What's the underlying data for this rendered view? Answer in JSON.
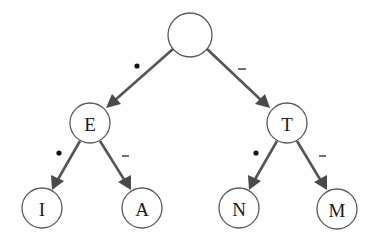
{
  "diagram": {
    "type": "binary-tree",
    "colors": {
      "node_stroke": "#5a5a5a",
      "edge": "#555555",
      "text": "#1a1a1a",
      "background": "#ffffff"
    },
    "nodes": [
      {
        "id": "root",
        "label": "",
        "cx": 190,
        "cy": 35,
        "r": 22
      },
      {
        "id": "E",
        "label": "E",
        "cx": 90,
        "cy": 123,
        "r": 20
      },
      {
        "id": "T",
        "label": "T",
        "cx": 287,
        "cy": 123,
        "r": 20
      },
      {
        "id": "I",
        "label": "I",
        "cx": 42,
        "cy": 208,
        "r": 20
      },
      {
        "id": "A",
        "label": "A",
        "cx": 142,
        "cy": 208,
        "r": 20
      },
      {
        "id": "N",
        "label": "N",
        "cx": 239,
        "cy": 208,
        "r": 20
      },
      {
        "id": "M",
        "label": "M",
        "cx": 337,
        "cy": 209,
        "r": 20
      }
    ],
    "edges": [
      {
        "from": "root",
        "to": "E",
        "symbol": "dot",
        "label": "•"
      },
      {
        "from": "root",
        "to": "T",
        "symbol": "dash",
        "label": "–"
      },
      {
        "from": "E",
        "to": "I",
        "symbol": "dot",
        "label": "•"
      },
      {
        "from": "E",
        "to": "A",
        "symbol": "dash",
        "label": "–"
      },
      {
        "from": "T",
        "to": "N",
        "symbol": "dot",
        "label": "•"
      },
      {
        "from": "T",
        "to": "M",
        "symbol": "dash",
        "label": "–"
      }
    ]
  }
}
